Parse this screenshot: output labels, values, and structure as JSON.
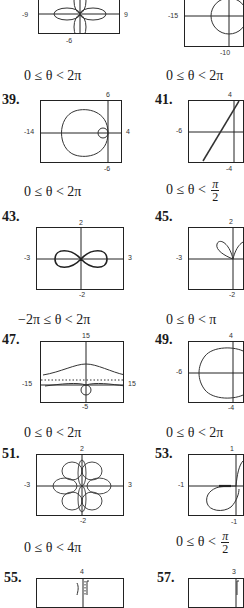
{
  "page": {
    "type": "textbook answer key excerpt (polar graphs)",
    "text_color": "#1a1a1a",
    "curve_color": "#333333"
  },
  "graphs": [
    {
      "id": "g37",
      "number": "",
      "shape": "four-petal rose",
      "ticks": {
        "left": "-9",
        "right": "9",
        "bottom": "-6"
      },
      "range": "0 ≤ θ < 2π"
    },
    {
      "id": "g38",
      "number": "",
      "shape": "circle",
      "ticks": {
        "left": "-15",
        "bottom": "-10"
      },
      "range": "0 ≤ θ < 2π"
    },
    {
      "id": "g39",
      "number": "39.",
      "shape": "limacon with inner loop",
      "ticks": {
        "left": "-14",
        "right": "4",
        "top": "6",
        "bottom": "-6"
      },
      "range": "0 ≤ θ < 2π"
    },
    {
      "id": "g41",
      "number": "41.",
      "shape": "line",
      "ticks": {
        "left": "-6",
        "top": "4",
        "bottom": "-4"
      },
      "range_prefix": "0 ≤ θ <",
      "range_frac_num": "π",
      "range_frac_den": "2"
    },
    {
      "id": "g43",
      "number": "43.",
      "shape": "lemniscate",
      "ticks": {
        "left": "-3",
        "right": "3",
        "top": "2",
        "bottom": "-2"
      },
      "range": "−2π ≤ θ < 2π"
    },
    {
      "id": "g45",
      "number": "45.",
      "shape": "two petals above axis",
      "ticks": {
        "left": "-3",
        "top": "2",
        "bottom": "-2"
      },
      "range": "0 ≤ θ < π"
    },
    {
      "id": "g47",
      "number": "47.",
      "shape": "conchoid with asymptote",
      "ticks": {
        "left": "-15",
        "right": "15",
        "top": "15",
        "bottom": "-5"
      },
      "range": "0 ≤ θ < 2π"
    },
    {
      "id": "g49",
      "number": "49.",
      "shape": "dimpled limacon",
      "ticks": {
        "left": "-6",
        "top": "4",
        "bottom": "-4"
      },
      "range": "0 ≤ θ < 2π"
    },
    {
      "id": "g51",
      "number": "51.",
      "shape": "six-petal rose",
      "ticks": {
        "left": "-3",
        "right": "3",
        "top": "2",
        "bottom": "-2"
      },
      "range": "0 ≤ θ < 4π"
    },
    {
      "id": "g53",
      "number": "53.",
      "shape": "spiral loop",
      "ticks": {
        "left": "-1",
        "top": "1",
        "bottom": "-1"
      },
      "range_prefix": "0 ≤ θ <",
      "range_frac_num": "π",
      "range_frac_den": "2"
    },
    {
      "id": "g55",
      "number": "55.",
      "shape": "partial (cut off)",
      "ticks": {
        "top": "4"
      }
    },
    {
      "id": "g57",
      "number": "57.",
      "shape": "partial (cut off)",
      "ticks": {
        "top": "3"
      }
    }
  ]
}
